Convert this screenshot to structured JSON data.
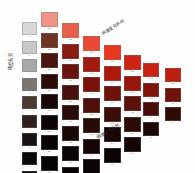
{
  "figure": {
    "background": "#fefefe",
    "caption_left": "明度系列",
    "caption_top_right": "纯度变化系列",
    "caption_bottom_right": "明度变化系列"
  },
  "chart_data": {
    "type": "heatmap",
    "xlabel": "纯度变化系列",
    "ylabel": "明度系列",
    "grid": false,
    "legend": "none",
    "layout": "staircase descending matrix, 8 columns of decreasing length",
    "columns": [
      {
        "index": 1,
        "x": 22,
        "y": 22,
        "chip_w": 15,
        "chip_h": 13,
        "gap": 2.2,
        "cells": [
          {
            "label": "a",
            "color": "#d8d8d8"
          },
          {
            "label": "b",
            "color": "#c8c8c8"
          },
          {
            "label": "c",
            "color": "#a8a8a8"
          },
          {
            "label": "d",
            "color": "#7c7570"
          },
          {
            "label": "e",
            "color": "#4a3a32"
          },
          {
            "label": "f",
            "color": "#2e211c"
          },
          {
            "label": "g",
            "color": "#1a1210"
          },
          {
            "label": "h",
            "color": "#0d0908"
          },
          {
            "label": "i",
            "color": "#070505"
          }
        ]
      },
      {
        "index": 2,
        "x": 41,
        "y": 12,
        "chip_w": 17,
        "chip_h": 15,
        "gap": 2.2,
        "cells": [
          {
            "label": "a-b",
            "color": "#ef9384"
          },
          {
            "label": "b-c",
            "color": "#6d3424"
          },
          {
            "label": "c-d",
            "color": "#4a1410"
          },
          {
            "label": "d-e",
            "color": "#2b0c0a"
          },
          {
            "label": "e-f",
            "color": "#170707"
          },
          {
            "label": "f-g",
            "color": "#0d0505"
          },
          {
            "label": "g-h",
            "color": "#090404"
          },
          {
            "label": "h-i",
            "color": "#060303"
          },
          {
            "label": "i-j",
            "color": "#040202"
          }
        ]
      },
      {
        "index": 3,
        "x": 62,
        "y": 23,
        "chip_w": 17,
        "chip_h": 15,
        "gap": 2.2,
        "cells": [
          {
            "label": "a-c",
            "color": "#e8604b"
          },
          {
            "label": "b-d",
            "color": "#8a1d12"
          },
          {
            "label": "c-e",
            "color": "#6a130d"
          },
          {
            "label": "d-f",
            "color": "#46100b"
          },
          {
            "label": "e-g",
            "color": "#2a0b08"
          },
          {
            "label": "f-h",
            "color": "#170707"
          },
          {
            "label": "g-i",
            "color": "#0c0505"
          },
          {
            "label": "h-j",
            "color": "#070303"
          }
        ]
      },
      {
        "index": 4,
        "x": 83,
        "y": 36,
        "chip_w": 17,
        "chip_h": 15,
        "gap": 2.2,
        "cells": [
          {
            "label": "a-d",
            "color": "#ea4a33"
          },
          {
            "label": "b-e",
            "color": "#a01b10"
          },
          {
            "label": "c-f",
            "color": "#78120b"
          },
          {
            "label": "d-g",
            "color": "#4c0f0a"
          },
          {
            "label": "e-h",
            "color": "#280a07"
          },
          {
            "label": "f-i",
            "color": "#130605"
          },
          {
            "label": "g-j",
            "color": "#0a0404"
          }
        ]
      },
      {
        "index": 5,
        "x": 104,
        "y": 45,
        "chip_w": 17,
        "chip_h": 15,
        "gap": 2.2,
        "cells": [
          {
            "label": "a-e",
            "color": "#e8371f"
          },
          {
            "label": "b-f",
            "color": "#ad1a0d"
          },
          {
            "label": "c-g",
            "color": "#6e120a"
          },
          {
            "label": "d-h",
            "color": "#3b0d07"
          },
          {
            "label": "e-i",
            "color": "#180705"
          },
          {
            "label": "f-j",
            "color": "#0b0404"
          }
        ]
      },
      {
        "index": 6,
        "x": 124,
        "y": 55,
        "chip_w": 17,
        "chip_h": 15,
        "gap": 2.2,
        "cells": [
          {
            "label": "a-f",
            "color": "#cf2413"
          },
          {
            "label": "b-g",
            "color": "#97170c"
          },
          {
            "label": "c-h",
            "color": "#5b1109"
          },
          {
            "label": "d-i",
            "color": "#2c0a06"
          },
          {
            "label": "e-j",
            "color": "#120605"
          }
        ]
      },
      {
        "index": 7,
        "x": 143,
        "y": 63,
        "chip_w": 16,
        "chip_h": 14,
        "gap": 2.2,
        "cells": [
          {
            "label": "a-g",
            "color": "#c92112"
          },
          {
            "label": "b-h",
            "color": "#82150b"
          },
          {
            "label": "c-i",
            "color": "#470f08"
          },
          {
            "label": "d-j",
            "color": "#1c0705"
          }
        ]
      },
      {
        "index": 8,
        "x": 165,
        "y": 68,
        "chip_w": 16,
        "chip_h": 14,
        "gap": 2.2,
        "cells": [
          {
            "label": "a-h",
            "color": "#bd1f11"
          },
          {
            "label": "b-i",
            "color": "#6e130a"
          },
          {
            "label": "c-j",
            "color": "#300b06"
          }
        ]
      }
    ]
  }
}
